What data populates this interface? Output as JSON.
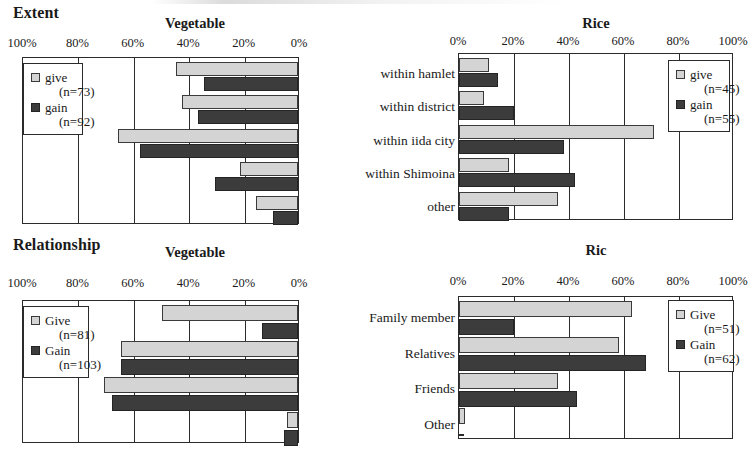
{
  "figure": {
    "sections": [
      {
        "name": "Extent",
        "label": "Extent"
      },
      {
        "name": "Relationship",
        "label": "Relationship"
      }
    ]
  },
  "chart_data": [
    {
      "id": "extent-vegetable",
      "type": "bar",
      "orientation": "horizontal",
      "direction": "rtl",
      "section": "Extent",
      "title": "Vegetable",
      "categories": [
        "within hamlet",
        "within district",
        "within iida city",
        "within Shimoina",
        "other"
      ],
      "tick_labels": [
        "100%",
        "80%",
        "60%",
        "40%",
        "20%",
        "0%"
      ],
      "ticks": [
        100,
        80,
        60,
        40,
        20,
        0
      ],
      "xlim": [
        0,
        100
      ],
      "xlabel": "",
      "ylabel": "",
      "grid": true,
      "legend_position": "left",
      "series": [
        {
          "name": "give",
          "label": "give",
          "n_label": "(n=73)",
          "n": 73,
          "color": "#d4d4d4",
          "values": [
            44,
            42,
            65,
            21,
            15
          ]
        },
        {
          "name": "gain",
          "label": "gain",
          "n_label": "(n=92)",
          "n": 92,
          "color": "#3c3c3c",
          "values": [
            34,
            36,
            57,
            30,
            9
          ]
        }
      ]
    },
    {
      "id": "extent-rice",
      "type": "bar",
      "orientation": "horizontal",
      "direction": "ltr",
      "section": "Extent",
      "title": "Rice",
      "categories": [
        "within hamlet",
        "within district",
        "within iida city",
        "within Shimoina",
        "other"
      ],
      "tick_labels": [
        "0%",
        "20%",
        "40%",
        "60%",
        "80%",
        "100%"
      ],
      "ticks": [
        0,
        20,
        40,
        60,
        80,
        100
      ],
      "xlim": [
        0,
        100
      ],
      "xlabel": "",
      "ylabel": "",
      "grid": true,
      "legend_position": "right",
      "series": [
        {
          "name": "give",
          "label": "give",
          "n_label": "(n=45)",
          "n": 45,
          "color": "#d4d4d4",
          "values": [
            11,
            9,
            71,
            18,
            36
          ]
        },
        {
          "name": "gain",
          "label": "gain",
          "n_label": "(n=55)",
          "n": 55,
          "color": "#3c3c3c",
          "values": [
            14,
            20,
            38,
            42,
            18
          ]
        }
      ]
    },
    {
      "id": "relationship-vegetable",
      "type": "bar",
      "orientation": "horizontal",
      "direction": "rtl",
      "section": "Relationship",
      "title": "Vegetable",
      "categories": [
        "Family member",
        "Relatives",
        "Friends",
        "Other"
      ],
      "tick_labels": [
        "100%",
        "80%",
        "60%",
        "40%",
        "20%",
        "0%"
      ],
      "ticks": [
        100,
        80,
        60,
        40,
        20,
        0
      ],
      "xlim": [
        0,
        100
      ],
      "xlabel": "",
      "ylabel": "",
      "grid": true,
      "legend_position": "left",
      "series": [
        {
          "name": "give",
          "label": "Give",
          "n_label": "(n=81)",
          "n": 81,
          "color": "#d4d4d4",
          "values": [
            49,
            64,
            70,
            4
          ]
        },
        {
          "name": "gain",
          "label": "Gain",
          "n_label": "(n=103)",
          "n": 103,
          "color": "#3c3c3c",
          "values": [
            13,
            64,
            67,
            5
          ]
        }
      ]
    },
    {
      "id": "relationship-rice",
      "type": "bar",
      "orientation": "horizontal",
      "direction": "ltr",
      "section": "Relationship",
      "title": "Ric",
      "categories": [
        "Family member",
        "Relatives",
        "Friends",
        "Other"
      ],
      "tick_labels": [
        "0%",
        "20%",
        "40%",
        "60%",
        "80%",
        "100%"
      ],
      "ticks": [
        0,
        20,
        40,
        60,
        80,
        100
      ],
      "xlim": [
        0,
        100
      ],
      "xlabel": "",
      "ylabel": "",
      "grid": true,
      "legend_position": "right",
      "series": [
        {
          "name": "give",
          "label": "Give",
          "n_label": "(n=51)",
          "n": 51,
          "color": "#d4d4d4",
          "values": [
            63,
            58,
            36,
            2
          ]
        },
        {
          "name": "gain",
          "label": "Gain",
          "n_label": "(n=62)",
          "n": 62,
          "color": "#3c3c3c",
          "values": [
            20,
            68,
            43,
            0
          ]
        }
      ]
    }
  ]
}
